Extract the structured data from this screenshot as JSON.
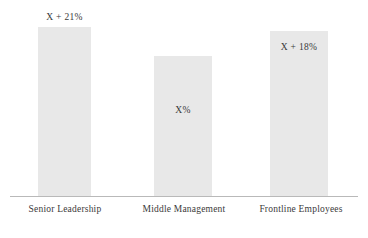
{
  "chart_data": {
    "type": "bar",
    "title": "",
    "subtitle": "",
    "xlabel": "",
    "ylabel": "",
    "grid": false,
    "legend": false,
    "axis_line": "horizontal-baseline-only",
    "categories": [
      "Senior Leadership",
      "Middle Management",
      "Frontline Employees"
    ],
    "value_labels": [
      "X + 21%",
      "X%",
      "X + 18%"
    ],
    "values": [
      121,
      100,
      118
    ],
    "ylim": [
      0,
      140
    ],
    "series": [
      {
        "name": "Perception",
        "values": [
          121,
          100,
          118
        ],
        "labels": [
          "X + 21%",
          "X%",
          "X + 18%"
        ]
      }
    ],
    "bar_color": "#e8e8e8",
    "text_color": "#3a3a3a",
    "axis_color": "#b9b9b9",
    "background_color": "#ffffff"
  },
  "bars": [
    {
      "category": "Senior Leadership",
      "label": "X + 21%"
    },
    {
      "category": "Middle Management",
      "label": "X%"
    },
    {
      "category": "Frontline Employees",
      "label": "X + 18%"
    }
  ]
}
